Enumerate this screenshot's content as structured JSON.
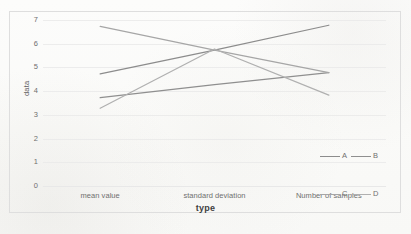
{
  "chart_data": {
    "type": "line",
    "title": "",
    "xlabel": "type",
    "ylabel": "data",
    "categories": [
      "mean value",
      "standard deviation",
      "Number of samples"
    ],
    "ylim": [
      0,
      7
    ],
    "yticks": [
      0,
      1,
      2,
      3,
      4,
      5,
      6,
      7
    ],
    "ytick_labels": [
      "0",
      "1",
      "2",
      "3",
      "4",
      "5",
      "6",
      "7"
    ],
    "grid": true,
    "legend_position": "bottom-right",
    "series": [
      {
        "name": "A",
        "values": [
          4.75,
          5.75,
          6.8
        ],
        "color": "#8c8c8c"
      },
      {
        "name": "B",
        "values": [
          3.75,
          4.3,
          4.8
        ],
        "color": "#8f8f8f"
      },
      {
        "name": "C",
        "values": [
          6.75,
          5.75,
          4.8
        ],
        "color": "#a6a6a6"
      },
      {
        "name": "D",
        "values": [
          3.3,
          5.8,
          3.85
        ],
        "color": "#b0b0b0"
      }
    ]
  },
  "axes": {
    "y_title": "data",
    "x_title": "type",
    "y_labels": [
      "7",
      "6",
      "5",
      "4",
      "3",
      "2",
      "1",
      "0"
    ],
    "x_labels": [
      "mean value",
      "standard deviation",
      "Number of samples"
    ]
  },
  "legend": {
    "entries": [
      {
        "label": "A",
        "color": "#8c8c8c"
      },
      {
        "label": "B",
        "color": "#8f8f8f"
      },
      {
        "label": "C",
        "color": "#a6a6a6"
      },
      {
        "label": "D",
        "color": "#b0b0b0"
      }
    ]
  },
  "style": {
    "grid_color": "#e8e8e8",
    "frame_color": "#dedede",
    "tick_text_color": "#6f6f6f",
    "axis_title_color": "#3f3f3f",
    "background": "#fcfcfb"
  }
}
